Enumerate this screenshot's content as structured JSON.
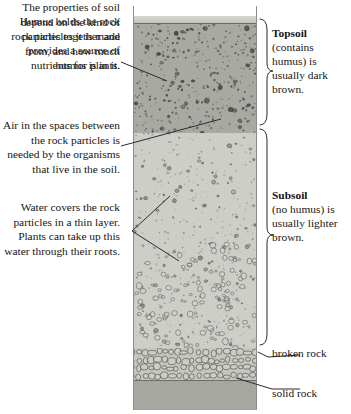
{
  "diagram": {
    "colors": {
      "topsoil": "#a9a9a4",
      "subsoil": "#cecec9",
      "broken_rock": "#c6c6c0",
      "solid_rock": "#a7a7a2",
      "surface": "#c2c1ba",
      "text": "#151515",
      "line": "#2b2b2b"
    }
  },
  "notes": {
    "humus": "Humus holds the rock particles together and provides a source of nutrients for plants.",
    "air": "Air in the spaces between the rock particles is needed by the organisms that live in the soil.",
    "water": "Water covers the rock particles in a thin layer. Plants can take up this water through their roots.",
    "properties": "The properties of soil depend on the kind of rock particles it is made from, and how much humus is in it."
  },
  "labels": {
    "topsoil": {
      "heading": "Topsoil",
      "body": "(contains humus) is usually dark brown."
    },
    "subsoil": {
      "heading": "Subsoil",
      "body": "(no humus) is usually lighter brown."
    },
    "broken_rock": "broken rock",
    "solid_rock": "solid rock"
  }
}
